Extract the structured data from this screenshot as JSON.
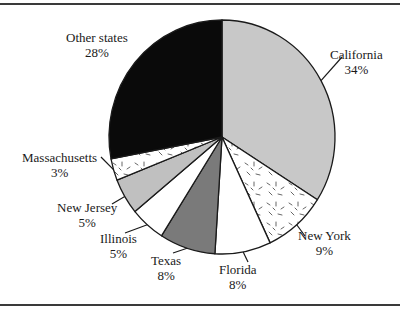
{
  "chart_data": {
    "type": "pie",
    "title": "",
    "slices": [
      {
        "label": "California",
        "pct_label": "34%",
        "value": 34,
        "fill": "#c8c8c8",
        "pattern": "none"
      },
      {
        "label": "New York",
        "pct_label": "9%",
        "value": 9,
        "fill": "#ffffff",
        "pattern": "dashes"
      },
      {
        "label": "Florida",
        "pct_label": "8%",
        "value": 8,
        "fill": "#ffffff",
        "pattern": "none"
      },
      {
        "label": "Texas",
        "pct_label": "8%",
        "value": 8,
        "fill": "#7a7a7a",
        "pattern": "none"
      },
      {
        "label": "Illinois",
        "pct_label": "5%",
        "value": 5,
        "fill": "#ffffff",
        "pattern": "none"
      },
      {
        "label": "New Jersey",
        "pct_label": "5%",
        "value": 5,
        "fill": "#c0c0c0",
        "pattern": "none"
      },
      {
        "label": "Massachusetts",
        "pct_label": "3%",
        "value": 3,
        "fill": "#ffffff",
        "pattern": "dashes"
      },
      {
        "label": "Other states",
        "pct_label": "28%",
        "value": 28,
        "fill": "#0a0a0a",
        "pattern": "none"
      }
    ],
    "start_angle_deg": 0,
    "direction": "clockwise",
    "legend": "none",
    "labels": "external with leader lines"
  },
  "colors": {
    "rule": "#3a3a3a",
    "outline": "#1a1a1a",
    "text": "#1a1a1a"
  }
}
